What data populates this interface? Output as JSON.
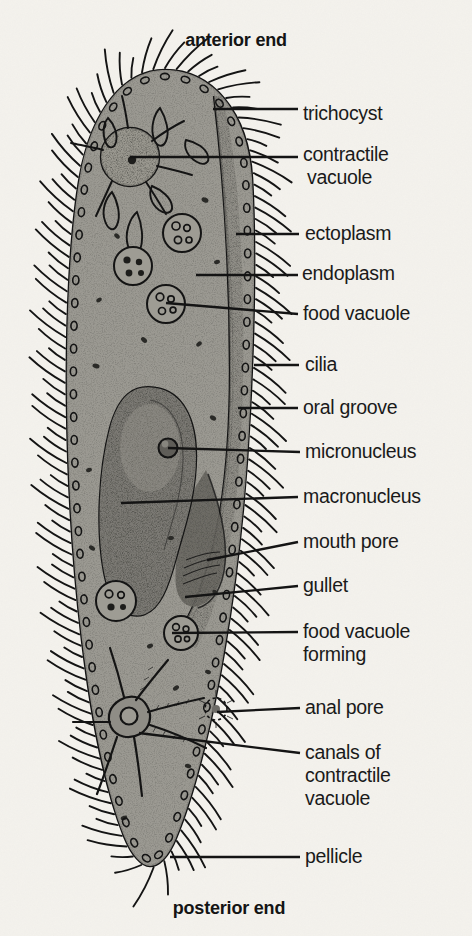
{
  "figure": {
    "organism": "Paramecium",
    "background_color": "#f4f2ed",
    "cell_fill_color": "#9c9a93",
    "ink_color": "#141414"
  },
  "end_labels": {
    "anterior": "anterior end",
    "posterior": "posterior end"
  },
  "callouts": [
    {
      "id": "trichocyst",
      "label": "trichocyst",
      "x": 303,
      "y": 102,
      "leader": {
        "x1": 213,
        "y1": 109,
        "x2": 298,
        "y2": 109
      }
    },
    {
      "id": "contractile-vacuole",
      "label": "contractile",
      "x": 303,
      "y": 143,
      "leader": {
        "x1": 130,
        "y1": 157,
        "x2": 298,
        "y2": 157
      }
    },
    {
      "id": "contractile-vacuole-2",
      "label": "vacuole",
      "x": 307,
      "y": 166,
      "leader": null
    },
    {
      "id": "ectoplasm",
      "label": "ectoplasm",
      "x": 305,
      "y": 222,
      "leader": {
        "x1": 236,
        "y1": 234,
        "x2": 299,
        "y2": 234
      }
    },
    {
      "id": "endoplasm",
      "label": "endoplasm",
      "x": 302,
      "y": 262,
      "leader": {
        "x1": 196,
        "y1": 275,
        "x2": 298,
        "y2": 275
      }
    },
    {
      "id": "food-vacuole",
      "label": "food vacuole",
      "x": 303,
      "y": 302,
      "leader": {
        "x1": 166,
        "y1": 303,
        "x2": 298,
        "y2": 314
      }
    },
    {
      "id": "cilia",
      "label": "cilia",
      "x": 305,
      "y": 353,
      "leader": {
        "x1": 254,
        "y1": 365,
        "x2": 299,
        "y2": 365
      }
    },
    {
      "id": "oral-groove",
      "label": "oral groove",
      "x": 303,
      "y": 396,
      "leader": {
        "x1": 238,
        "y1": 408,
        "x2": 298,
        "y2": 408
      }
    },
    {
      "id": "micronucleus",
      "label": "micronucleus",
      "x": 305,
      "y": 440,
      "leader": {
        "x1": 168,
        "y1": 448,
        "x2": 300,
        "y2": 452
      }
    },
    {
      "id": "macronucleus",
      "label": "macronucleus",
      "x": 303,
      "y": 485,
      "leader": {
        "x1": 121,
        "y1": 503,
        "x2": 298,
        "y2": 497
      }
    },
    {
      "id": "mouth-pore",
      "label": "mouth pore",
      "x": 303,
      "y": 530,
      "leader": {
        "x1": 207,
        "y1": 560,
        "x2": 298,
        "y2": 542
      }
    },
    {
      "id": "gullet",
      "label": "gullet",
      "x": 303,
      "y": 574,
      "leader": {
        "x1": 185,
        "y1": 597,
        "x2": 298,
        "y2": 586
      }
    },
    {
      "id": "food-vacuole-forming",
      "label": "food vacuole",
      "x": 303,
      "y": 620,
      "leader": {
        "x1": 172,
        "y1": 633,
        "x2": 298,
        "y2": 632
      }
    },
    {
      "id": "food-vacuole-forming-2",
      "label": "forming",
      "x": 303,
      "y": 643,
      "leader": null
    },
    {
      "id": "anal-pore",
      "label": "anal  pore",
      "x": 305,
      "y": 696,
      "leader": {
        "x1": 217,
        "y1": 712,
        "x2": 300,
        "y2": 708
      }
    },
    {
      "id": "canals-of",
      "label": "canals of",
      "x": 305,
      "y": 741,
      "leader": {
        "x1": 139,
        "y1": 733,
        "x2": 300,
        "y2": 753
      }
    },
    {
      "id": "canals-contractile",
      "label": "contractile",
      "x": 305,
      "y": 764,
      "leader": null
    },
    {
      "id": "canals-vacuole",
      "label": "vacuole",
      "x": 305,
      "y": 787,
      "leader": null
    },
    {
      "id": "pellicle",
      "label": "pellicle",
      "x": 305,
      "y": 845,
      "leader": {
        "x1": 170,
        "y1": 857,
        "x2": 300,
        "y2": 857
      }
    }
  ]
}
